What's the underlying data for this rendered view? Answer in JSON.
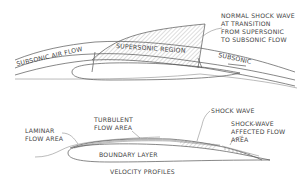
{
  "upper_diagram": {
    "labels": {
      "subsonic_air_flow": "SUBSONIC AIR FLOW",
      "supersonic_region": "SUPERSONIC REGION",
      "subsonic": "SUBSONIC",
      "shock_line1": "NORMAL SHOCK WAVE",
      "shock_line2": "AT TRANSITION",
      "shock_line3": "FROM SUPERSONIC",
      "shock_line4": "TO SUBSONIC FLOW"
    }
  },
  "lower_diagram": {
    "labels": {
      "laminar_line1": "LAMINAR",
      "laminar_line2": "FLOW AREA",
      "turbulent_line1": "TURBULENT",
      "turbulent_line2": "FLOW AREA",
      "boundary_layer": "BOUNDARY LAYER",
      "shock_wave": "SHOCK WAVE",
      "affected_line1": "SHOCK-WAVE",
      "affected_line2": "AFFECTED FLOW",
      "affected_line3": "AREA"
    },
    "caption": "VELOCITY PROFILES"
  },
  "colors": {
    "line": "#555555",
    "text": "#444444",
    "background": "#ffffff"
  }
}
